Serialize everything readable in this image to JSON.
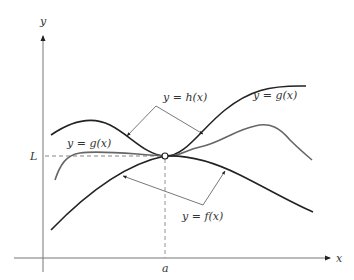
{
  "figure": {
    "axes": {
      "x_label": "x",
      "y_label": "y",
      "point_x_label": "a",
      "point_y_label": "L"
    },
    "curves": [
      {
        "name": "h",
        "label": "y = h(x)",
        "color": "#222222",
        "role": "upper bound"
      },
      {
        "name": "g",
        "label": "y = g(x)",
        "color": "#666666",
        "role": "squeezed function"
      },
      {
        "name": "f",
        "label": "y = f(x)",
        "color": "#222222",
        "role": "lower bound"
      }
    ],
    "labels": {
      "h": "y = h(x)",
      "g_right": "y = g(x)",
      "g_left": "y = g(x)",
      "f": "y = f(x)"
    },
    "limit_point": {
      "x": "a",
      "y": "L",
      "marker": "open-circle"
    }
  }
}
